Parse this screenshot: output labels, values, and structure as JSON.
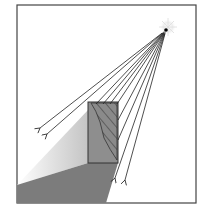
{
  "diagram": {
    "title": "",
    "frame": {
      "x": 17,
      "y": 5,
      "width": 179,
      "height": 198,
      "stroke": "#444444"
    },
    "light_source": {
      "cx": 166,
      "cy": 30,
      "core": "#000000",
      "glow": "#e8e8e8",
      "label": ""
    },
    "object_box": {
      "x": 88,
      "y": 102,
      "width": 30,
      "height": 61,
      "fill": "#8c8c8c",
      "stroke": "#333333"
    },
    "shadow": {
      "fill": "#7a7a7a"
    },
    "lit_surface": {
      "from": "#ffffff",
      "to": "#c8c8c8"
    },
    "rays": [
      {
        "x2": 40,
        "y2": 128
      },
      {
        "x2": 47,
        "y2": 134
      },
      {
        "x2": 96,
        "y2": 104
      },
      {
        "x2": 103,
        "y2": 110
      },
      {
        "x2": 110,
        "y2": 118
      },
      {
        "x2": 115,
        "y2": 178
      },
      {
        "x2": 125,
        "y2": 180
      }
    ],
    "ray_color": "#222222",
    "labels": []
  }
}
